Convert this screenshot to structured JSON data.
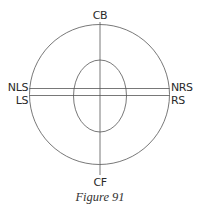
{
  "figure": {
    "caption": "Figure 91",
    "labels": {
      "top": "CB",
      "bottom": "CF",
      "left_upper": "NLS",
      "left_lower": "LS",
      "right_upper": "NRS",
      "right_lower": "RS"
    },
    "shapes": {
      "outer_circle": {
        "cx": 99.5,
        "cy": 94.5,
        "r": 70
      },
      "inner_ellipse": {
        "cx": 100,
        "cy": 96,
        "rx": 26.5,
        "ry": 36
      },
      "horizontal_lines_y": [
        88.5,
        95.5
      ],
      "vertical_line": {
        "x": 100,
        "y1": 22,
        "y2": 175
      }
    },
    "colors": {
      "line": "#555555",
      "text": "#2a2a2a"
    }
  }
}
